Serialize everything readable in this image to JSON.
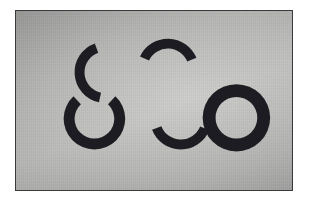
{
  "scene": {
    "title": "Photograph of five black cut-paper arc shapes on gray paper",
    "medium": "photograph",
    "canvas": {
      "width": 309,
      "height": 207,
      "background": "#ffffff"
    },
    "photo_plate": {
      "x": 15,
      "y": 10,
      "width": 278,
      "height": 181,
      "border_color": "#3a3a3c",
      "border_width": 1,
      "paper_color": "#a2a2a0",
      "paper_highlight": "#b6b6b4",
      "paper_shadow": "#8d8d8c"
    },
    "shape_color": "#1f1f22",
    "shape_count": 5
  },
  "shapes": [
    {
      "id": "arc-top-left",
      "name": "upper-left crescent arc",
      "role": "partial annulus, opening downward",
      "center_x": 105,
      "center_y": 72,
      "outer_radius": 31,
      "inner_radius": 21,
      "start_angle_deg": 192,
      "end_angle_deg": 340,
      "sweep_deg": 148,
      "color": "#1f1f22"
    },
    {
      "id": "arc-left-c",
      "name": "large C arc",
      "role": "partial annulus, opening to the right",
      "center_x": 94,
      "center_y": 119,
      "outer_radius": 31,
      "inner_radius": 20,
      "start_angle_deg": 43,
      "end_angle_deg": 317,
      "sweep_deg": 274,
      "color": "#1f1f22"
    },
    {
      "id": "arc-middle-upper",
      "name": "middle upper arc",
      "role": "partial annulus, opening to the left",
      "center_x": 168,
      "center_y": 69,
      "outer_radius": 31,
      "inner_radius": 21,
      "start_angle_deg": 295,
      "end_angle_deg": 68,
      "sweep_deg": 133,
      "color": "#1f1f22"
    },
    {
      "id": "arc-middle-lower",
      "name": "middle lower arc",
      "role": "partial annulus, opening to the right",
      "center_x": 181,
      "center_y": 119,
      "outer_radius": 31,
      "inner_radius": 21,
      "start_angle_deg": 112,
      "end_angle_deg": 249,
      "sweep_deg": 137,
      "color": "#1f1f22"
    },
    {
      "id": "ring-right",
      "name": "complete O ring",
      "role": "full annulus",
      "center_x": 237,
      "center_y": 118,
      "outer_radius": 34,
      "inner_radius": 21,
      "start_angle_deg": 0,
      "end_angle_deg": 360,
      "sweep_deg": 360,
      "color": "#1f1f22"
    }
  ]
}
